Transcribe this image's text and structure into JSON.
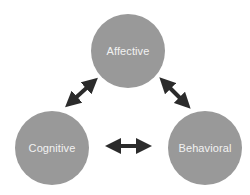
{
  "diagram": {
    "type": "triangle-relationship",
    "nodes": [
      {
        "id": "affective",
        "label": "Affective"
      },
      {
        "id": "cognitive",
        "label": "Cognitive"
      },
      {
        "id": "behavioral",
        "label": "Behavioral"
      }
    ],
    "edges": [
      {
        "from": "affective",
        "to": "cognitive",
        "direction": "bidirectional"
      },
      {
        "from": "affective",
        "to": "behavioral",
        "direction": "bidirectional"
      },
      {
        "from": "cognitive",
        "to": "behavioral",
        "direction": "bidirectional"
      }
    ],
    "colors": {
      "node_fill": "#999999",
      "node_text": "#f2f2f2",
      "arrow": "#2b2b2b",
      "background": "#ffffff"
    }
  }
}
